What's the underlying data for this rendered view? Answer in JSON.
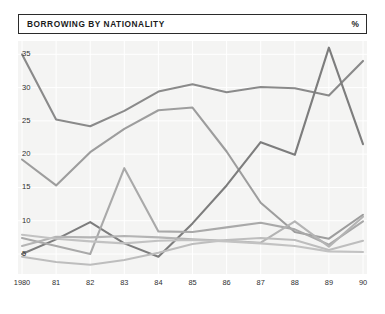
{
  "header": {
    "title": "BORROWING BY NATIONALITY",
    "unit": "%"
  },
  "chart_data": {
    "type": "line",
    "title": "BORROWING BY NATIONALITY",
    "xlabel": "",
    "ylabel": "%",
    "unit": "%",
    "grid": true,
    "legend": "none",
    "xlim": [
      1980,
      1990
    ],
    "ylim": [
      2.0,
      37.0
    ],
    "yticks": [
      5,
      10,
      15,
      20,
      25,
      30,
      35
    ],
    "ytick_labels": [
      "5",
      "10",
      "15",
      "20",
      "25",
      "30",
      "35"
    ],
    "x": [
      1980,
      1981,
      1982,
      1983,
      1984,
      1985,
      1986,
      1987,
      1988,
      1989,
      1990
    ],
    "xtick_labels": [
      "1980",
      "81",
      "82",
      "83",
      "84",
      "85",
      "86",
      "87",
      "88",
      "89",
      "90"
    ],
    "series": [
      {
        "name": "series-1",
        "color": "#8a8a8a",
        "values": [
          35.0,
          25.2,
          24.2,
          26.5,
          29.4,
          30.5,
          29.3,
          30.1,
          29.9,
          28.8,
          34.0
        ]
      },
      {
        "name": "series-2",
        "color": "#9d9d9d",
        "values": [
          19.2,
          15.3,
          20.3,
          23.8,
          26.6,
          27.0,
          20.4,
          12.7,
          8.3,
          7.3,
          10.9
        ]
      },
      {
        "name": "series-3",
        "color": "#7d7d7d",
        "values": [
          5.0,
          7.2,
          9.8,
          6.6,
          4.6,
          9.6,
          15.3,
          21.8,
          19.9,
          36.0,
          21.5
        ]
      },
      {
        "name": "series-4",
        "color": "#a9a9a9",
        "values": [
          7.4,
          6.2,
          5.0,
          17.9,
          8.4,
          8.3,
          9.0,
          9.7,
          8.7,
          6.4,
          9.9
        ]
      },
      {
        "name": "series-5",
        "color": "#b4b4b4",
        "values": [
          6.2,
          7.6,
          7.5,
          7.7,
          7.5,
          7.2,
          7.0,
          6.7,
          9.9,
          6.1,
          10.6
        ]
      },
      {
        "name": "series-6",
        "color": "#bdbdbd",
        "values": [
          4.6,
          3.8,
          3.4,
          4.1,
          5.2,
          6.5,
          7.1,
          7.4,
          7.1,
          5.6,
          7.0
        ]
      },
      {
        "name": "series-7",
        "color": "#c2c2c2",
        "values": [
          7.9,
          7.3,
          6.9,
          6.6,
          7.0,
          7.1,
          6.9,
          6.6,
          6.2,
          5.4,
          5.3
        ]
      }
    ]
  }
}
